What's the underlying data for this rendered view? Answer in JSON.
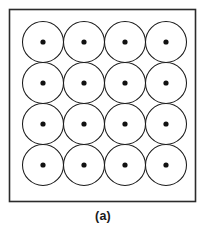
{
  "figure": {
    "caption": "(a)",
    "colors": {
      "background": "#ffffff",
      "frame_stroke": "#2b2b2b",
      "circle_stroke": "#1a1a1a",
      "circle_fill": "#ffffff",
      "dot_fill": "#111111",
      "caption_color": "#1a1a1a"
    },
    "frame": {
      "x": 9.5,
      "y": 9.5,
      "width": 186,
      "height": 192,
      "stroke_width": 1.6
    },
    "grid": {
      "rows": 4,
      "columns": 4,
      "circle_count": 16,
      "radius": 20.5,
      "diameter": 41,
      "packing": "square",
      "tangent": true,
      "origin_x": 22.5,
      "origin_y": 21.5,
      "spacing": 41,
      "dot_radius": 2.6
    },
    "circles": [
      {
        "row": 1,
        "col": 1,
        "cx": 43.0,
        "cy": 42.0
      },
      {
        "row": 1,
        "col": 2,
        "cx": 84.0,
        "cy": 42.0
      },
      {
        "row": 1,
        "col": 3,
        "cx": 125.0,
        "cy": 42.0
      },
      {
        "row": 1,
        "col": 4,
        "cx": 166.0,
        "cy": 42.0
      },
      {
        "row": 2,
        "col": 1,
        "cx": 43.0,
        "cy": 83.0
      },
      {
        "row": 2,
        "col": 2,
        "cx": 84.0,
        "cy": 83.0
      },
      {
        "row": 2,
        "col": 3,
        "cx": 125.0,
        "cy": 83.0
      },
      {
        "row": 2,
        "col": 4,
        "cx": 166.0,
        "cy": 83.0
      },
      {
        "row": 3,
        "col": 1,
        "cx": 43.0,
        "cy": 124.0
      },
      {
        "row": 3,
        "col": 2,
        "cx": 84.0,
        "cy": 124.0
      },
      {
        "row": 3,
        "col": 3,
        "cx": 125.0,
        "cy": 124.0
      },
      {
        "row": 3,
        "col": 4,
        "cx": 166.0,
        "cy": 124.0
      },
      {
        "row": 4,
        "col": 1,
        "cx": 43.0,
        "cy": 165.0
      },
      {
        "row": 4,
        "col": 2,
        "cx": 84.0,
        "cy": 165.0
      },
      {
        "row": 4,
        "col": 3,
        "cx": 125.0,
        "cy": 165.0
      },
      {
        "row": 4,
        "col": 4,
        "cx": 166.0,
        "cy": 165.0
      }
    ]
  }
}
